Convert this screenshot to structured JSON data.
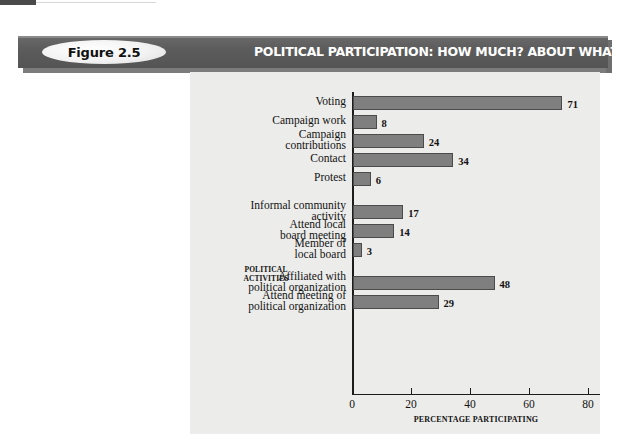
{
  "figure": {
    "badge_label": "Figure 2.5",
    "banner_title": "POLITICAL PARTICIPATION: HOW MUCH? ABOUT WHAT?"
  },
  "colors": {
    "banner": "#5c5c5c",
    "panel_background": "#ececea",
    "bar_fill": "#7f7f7f",
    "bar_border": "#4b4b4b",
    "axis": "#1d1d1d",
    "text": "#121212"
  },
  "chart_data": {
    "type": "bar",
    "orientation": "horizontal",
    "title": "POLITICAL PARTICIPATION: HOW MUCH? ABOUT WHAT?",
    "xlabel": "PERCENTAGE PARTICIPATING",
    "ylabel": "POLITICAL\nACTIVITIES",
    "xlim": [
      0,
      80
    ],
    "xticks": [
      0,
      20,
      40,
      60,
      80
    ],
    "grid": false,
    "legend": "none",
    "categories": [
      "Voting",
      "Campaign work",
      "Campaign\ncontributions",
      "Contact",
      "Protest",
      "Informal community\nactivity",
      "Attend local\nboard meeting",
      "Member of\nlocal board",
      "Affiliated with\npolitical organization",
      "Attend meeting of\npolitical organization"
    ],
    "values": [
      71,
      8,
      24,
      34,
      6,
      17,
      14,
      3,
      48,
      29
    ],
    "value_labels": [
      "71",
      "8",
      "24",
      "34",
      "6",
      "17",
      "14",
      "3",
      "48",
      "29"
    ],
    "groups": [
      {
        "name": "electoral",
        "indices": [
          0,
          1,
          2,
          3,
          4
        ]
      },
      {
        "name": "community",
        "indices": [
          5,
          6,
          7
        ]
      },
      {
        "name": "organizational",
        "indices": [
          8,
          9
        ]
      }
    ]
  }
}
